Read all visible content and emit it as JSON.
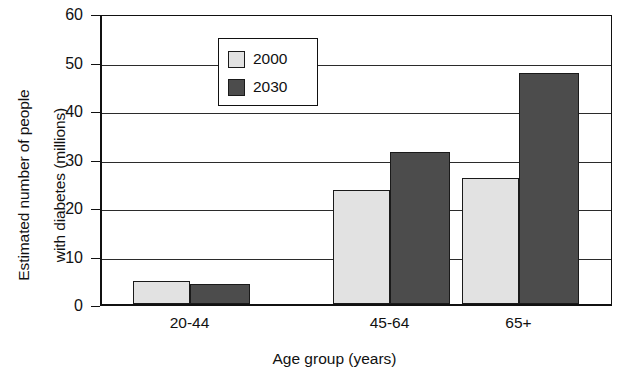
{
  "chart_data": {
    "type": "bar",
    "title": "",
    "xlabel": "Age group (years)",
    "ylabel_line1": "Estimated number of people",
    "ylabel_line2": "with diabetes (millions)",
    "categories": [
      "20-44",
      "45-64",
      "65+"
    ],
    "series": [
      {
        "name": "2000",
        "values": [
          4.7,
          23.5,
          26.0
        ],
        "color": "#e2e2e2"
      },
      {
        "name": "2030",
        "values": [
          4.2,
          31.4,
          47.7
        ],
        "color": "#4c4c4c"
      }
    ],
    "ylim": [
      0,
      60
    ],
    "ytick_labels": [
      "60",
      "50",
      "40",
      "30",
      "20",
      "10",
      "0"
    ],
    "ytick_values": [
      60,
      50,
      40,
      30,
      20,
      10,
      0
    ],
    "grid": "horizontal",
    "legend_position": "top-left",
    "legend_entries": [
      "2000",
      "2030"
    ]
  }
}
